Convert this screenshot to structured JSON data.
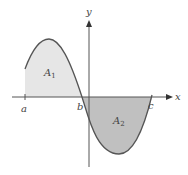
{
  "diagram": {
    "type": "area-under-curve",
    "axes": {
      "x_label": "x",
      "y_label": "y"
    },
    "points": {
      "a": "a",
      "b": "b",
      "c": "c"
    },
    "regions": [
      {
        "name": "A",
        "subscript": "1",
        "position": "above x-axis, between a and b",
        "fill": "#e6e6e6"
      },
      {
        "name": "A",
        "subscript": "2",
        "position": "below x-axis, between b and c",
        "fill": "#c0c0c0"
      }
    ],
    "colors": {
      "curve": "#555555",
      "axis": "#555555",
      "region_1_fill": "#e6e6e6",
      "region_2_fill": "#c0c0c0",
      "text": "#444444"
    }
  }
}
